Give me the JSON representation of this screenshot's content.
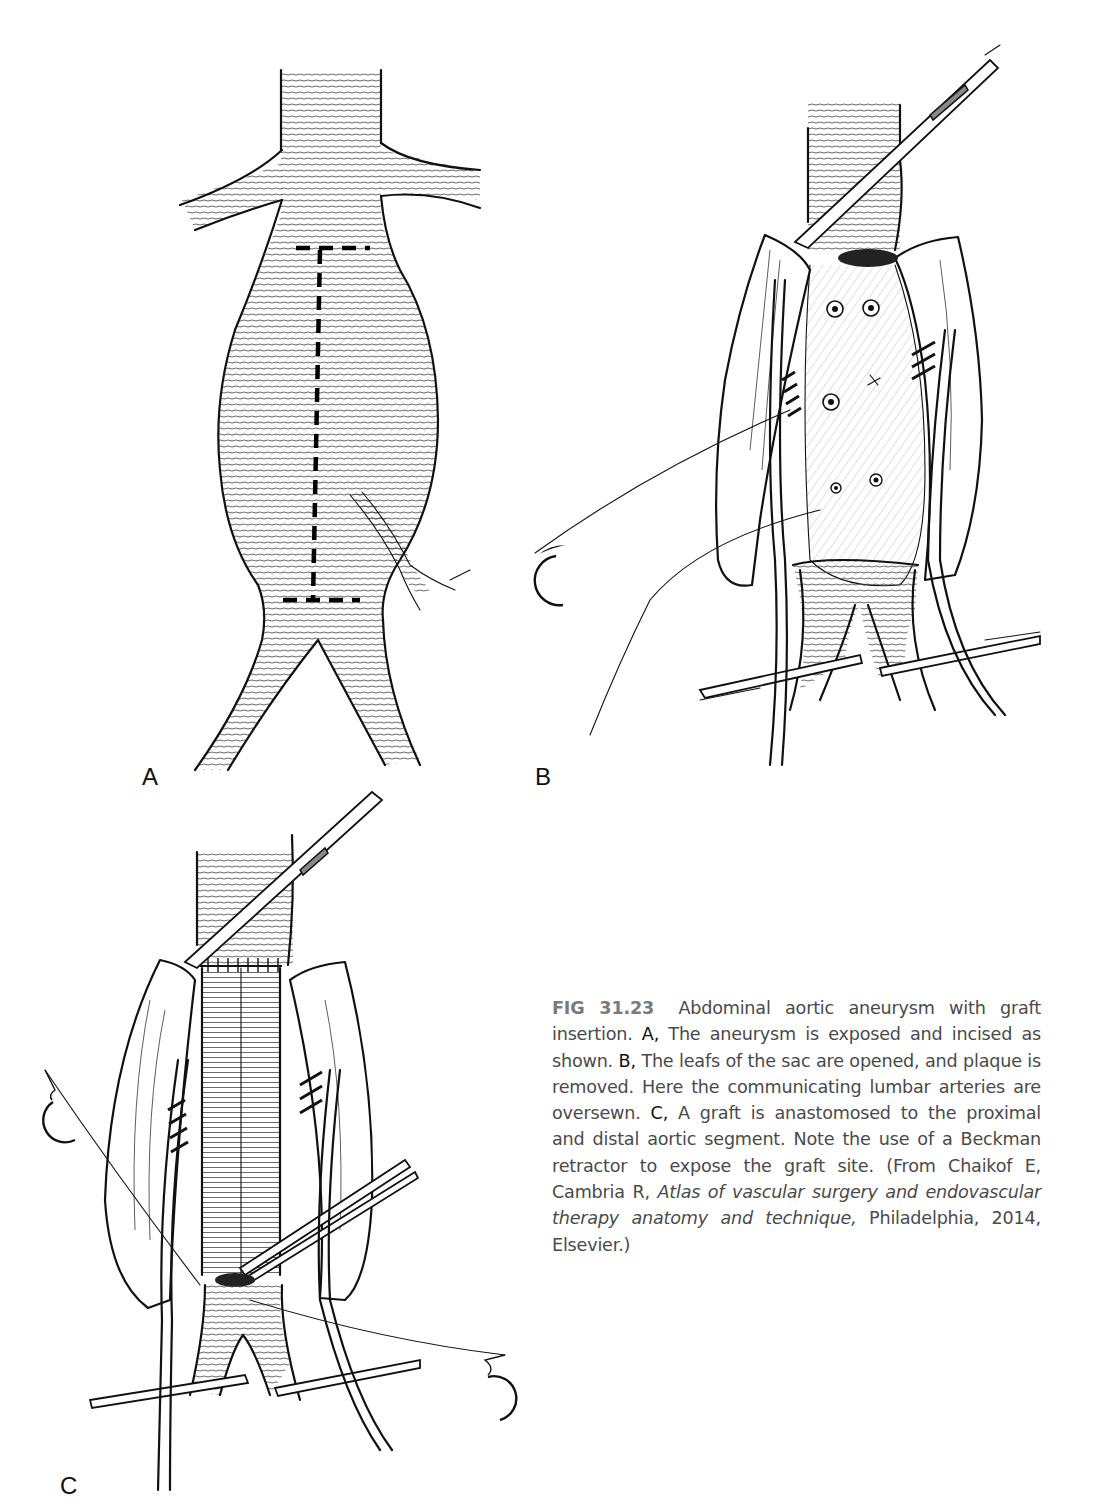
{
  "figure": {
    "number": "FIG 31.23",
    "panels": [
      {
        "id": "A",
        "label": "A",
        "depicts": "Infrarenal abdominal aortic aneurysm with dashed incision line"
      },
      {
        "id": "B",
        "label": "B",
        "depicts": "Opened aneurysm sac with lumbar arteries oversewn and iliac clamps"
      },
      {
        "id": "C",
        "label": "C",
        "depicts": "Tube graft anastomosed within sac, Beckman retractor exposing graft site"
      }
    ],
    "caption": {
      "lead": "Abdominal aortic aneurysm with graft insertion.",
      "a_key": "A,",
      "a_text": "The aneurysm is exposed and incised as shown.",
      "b_key": "B,",
      "b_text": "The leafs of the sac are opened, and plaque is removed. Here the communicating lumbar arteries are oversewn.",
      "c_key": "C,",
      "c_text": "A graft is anastomosed to the proximal and distal aortic segment. Note the use of a Beckman retractor to expose the graft site.",
      "source_prefix": "(From Chaikof E, Cambria R,",
      "source_title": "Atlas of vascular surgery and endovascular therapy anatomy and technique,",
      "source_suffix": "Philadelphia, 2014, Elsevier.)"
    }
  },
  "colors": {
    "ink": "#111111",
    "caption_text": "#4a4a4a",
    "figure_number": "#7a7a7a",
    "background": "#ffffff"
  }
}
